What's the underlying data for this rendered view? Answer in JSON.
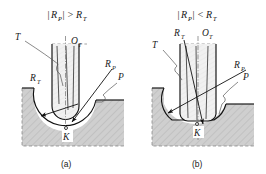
{
  "figure": {
    "panels": [
      {
        "id": "a",
        "caption": "(a)",
        "title": "|R_P| > R_T",
        "title_parts": {
          "bar_open": "|",
          "r": "R",
          "r_sub": "P",
          "bar_close": "|",
          "relation": ">",
          "rt": "R",
          "rt_sub": "T"
        },
        "labels": {
          "tool": "T",
          "tool_axis": "O",
          "tool_axis_sub": "T",
          "tool_radius": "R",
          "tool_radius_sub": "T",
          "part_radius": "R",
          "part_radius_sub": "P",
          "part": "P",
          "contact_point": "K"
        }
      },
      {
        "id": "b",
        "caption": "(b)",
        "title": "|R_P| < R_T",
        "title_parts": {
          "bar_open": "|",
          "r": "R",
          "r_sub": "P",
          "bar_close": "|",
          "relation": "<",
          "rt": "R",
          "rt_sub": "T"
        },
        "labels": {
          "tool": "T",
          "tool_axis": "O",
          "tool_axis_sub": "T",
          "tool_radius": "R",
          "tool_radius_sub": "T",
          "part_radius": "R",
          "part_radius_sub": "P",
          "part": "P",
          "contact_point": "K"
        }
      }
    ],
    "colors": {
      "workpiece_fill": "#c9c9c9",
      "tool_fill": "#ececec",
      "outline": "#111111",
      "dashed": "#7d7d7d",
      "background": "#ffffff"
    }
  }
}
